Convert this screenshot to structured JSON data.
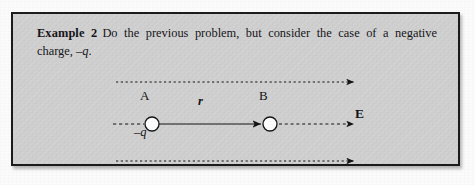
{
  "page": {
    "background_color": "#fbfbfb",
    "box_background_color": "#cfcfcf",
    "border_color": "#1b1b1b",
    "ink_color": "#141414"
  },
  "example": {
    "label": "Example 2",
    "body_part1": "Do the previous problem, but consider the case of a negative charge, ",
    "body_charge": "–q",
    "body_part2": "."
  },
  "diagram": {
    "type": "physics-field-diagram",
    "charges": [
      {
        "id": "A",
        "label": "A",
        "sublabel": "–q",
        "cx": 139,
        "cy": 110,
        "r": 7,
        "fill": "#ffffff",
        "stroke": "#141414"
      },
      {
        "id": "B",
        "label": "B",
        "sublabel": "",
        "cx": 257,
        "cy": 110,
        "r": 7,
        "fill": "#ffffff",
        "stroke": "#141414"
      }
    ],
    "vector": {
      "label": "r",
      "from_x": 146,
      "to_x": 250,
      "y": 110,
      "style": "solid",
      "arrowhead": true
    },
    "field_lines": [
      {
        "id": "field-line-top",
        "y": 68,
        "x_start": 103,
        "x_end": 345,
        "style": "dashed",
        "arrowhead": true,
        "label": ""
      },
      {
        "id": "field-line-middle-left",
        "y": 110,
        "x_start": 100,
        "x_end": 131,
        "style": "dashed",
        "arrowhead": false,
        "label": ""
      },
      {
        "id": "field-line-middle-right",
        "y": 110,
        "x_start": 265,
        "x_end": 345,
        "style": "dashed",
        "arrowhead": true,
        "label": "E"
      },
      {
        "id": "field-line-bottom",
        "y": 147,
        "x_start": 103,
        "x_end": 345,
        "style": "dashed",
        "arrowhead": true,
        "label": ""
      }
    ],
    "field_label": "E"
  }
}
